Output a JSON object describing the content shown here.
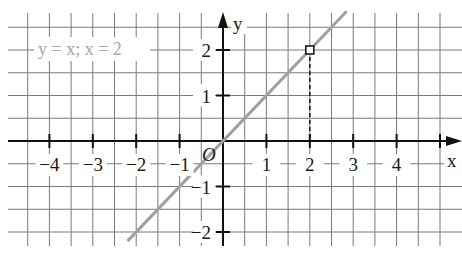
{
  "chart_data": {
    "type": "line",
    "title": "",
    "annotation": "y = x;  x = 2",
    "xlabel": "x",
    "ylabel": "y",
    "origin_label": "O",
    "x_ticks": [
      -4,
      -3,
      -2,
      -1,
      1,
      2,
      3,
      4
    ],
    "x_tick_labels": [
      "−4",
      "−3",
      "−2",
      "−1",
      "1",
      "2",
      "3",
      "4"
    ],
    "y_ticks": [
      -2,
      -1,
      1,
      2
    ],
    "y_tick_labels": [
      "−2",
      "−1",
      "1",
      "2"
    ],
    "xlim": [
      -4.5,
      5.3
    ],
    "ylim": [
      -2.3,
      2.8
    ],
    "grid": true,
    "grid_step": 0.5,
    "series": [
      {
        "name": "y = x",
        "color": "#a0a0a0",
        "x": [
          -2.2,
          -2,
          -1,
          0,
          1,
          2,
          2.85
        ],
        "y": [
          -2.2,
          -2,
          -1,
          0,
          1,
          2,
          2.85
        ]
      }
    ],
    "highlighted_point": {
      "x": 2,
      "y": 2,
      "marker": "open-square"
    },
    "dashed_projection": {
      "from": [
        2,
        2
      ],
      "to": [
        2,
        0
      ]
    }
  }
}
